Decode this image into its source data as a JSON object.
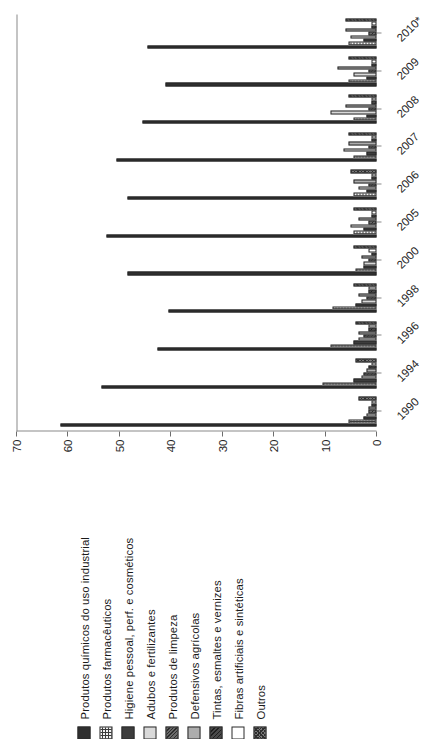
{
  "chart_data": {
    "type": "bar",
    "title": "",
    "xlabel": "",
    "ylabel": "",
    "ylim": [
      0,
      70
    ],
    "yticks": [
      0,
      10,
      20,
      30,
      40,
      50,
      60,
      70
    ],
    "grid": false,
    "orientation": "vertical-groups-rotated",
    "legend_position": "top-left",
    "categories": [
      "1990",
      "1994",
      "1996",
      "1998",
      "2000",
      "2005",
      "2006",
      "2007",
      "2008",
      "2009",
      "2010*"
    ],
    "series": [
      {
        "name": "Produtos químicos do uso industrial",
        "pattern": "solid-dark",
        "values": [
          61.5,
          53.5,
          42.5,
          40.5,
          48.5,
          52.5,
          48.5,
          50.5,
          45.5,
          41.0,
          44.5
        ]
      },
      {
        "name": "Produtos farmacêuticos",
        "pattern": "grid-hatch",
        "values": [
          5.5,
          10.5,
          9.0,
          8.5,
          4.0,
          4.5,
          4.5,
          4.5,
          4.5,
          5.5,
          5.5
        ]
      },
      {
        "name": "Higiene pessoal, perf. e cosméticos",
        "pattern": "solid-dark-2",
        "values": [
          2.5,
          4.5,
          4.5,
          4.0,
          2.5,
          2.5,
          2.0,
          2.0,
          2.0,
          2.0,
          2.5
        ]
      },
      {
        "name": "Adubos e fertilizantes",
        "pattern": "very-light",
        "values": [
          2.0,
          3.0,
          3.5,
          3.0,
          2.5,
          5.0,
          3.5,
          6.5,
          9.0,
          4.5,
          5.0
        ]
      },
      {
        "name": "Produtos de limpeza",
        "pattern": "dense-hatch",
        "values": [
          1.5,
          2.5,
          2.5,
          2.0,
          1.5,
          1.5,
          1.5,
          1.5,
          1.5,
          1.5,
          1.5
        ]
      },
      {
        "name": "Defensivos agrícolas",
        "pattern": "mid-grey",
        "values": [
          1.5,
          2.0,
          3.5,
          3.5,
          3.0,
          3.5,
          4.5,
          5.5,
          6.0,
          7.5,
          6.0
        ]
      },
      {
        "name": "Tintas, esmaltes e vernizes",
        "pattern": "diag-hatch",
        "values": [
          1.0,
          1.5,
          1.5,
          1.5,
          1.0,
          1.0,
          1.0,
          1.0,
          1.0,
          1.0,
          1.0
        ]
      },
      {
        "name": "Fibras artificiais e sintéticas",
        "pattern": "white",
        "values": [
          1.0,
          1.0,
          1.5,
          1.5,
          1.5,
          1.0,
          1.0,
          1.0,
          1.0,
          1.0,
          1.0
        ]
      },
      {
        "name": "Outros",
        "pattern": "cross-hatch",
        "values": [
          3.5,
          4.0,
          4.0,
          4.5,
          4.5,
          4.5,
          5.0,
          5.5,
          5.5,
          5.5,
          6.0
        ]
      }
    ]
  },
  "legend": {
    "items": [
      {
        "label": "Produtos químicos do uso industrial",
        "swatch": "swatch-solid-dark"
      },
      {
        "label": "Produtos farmacêuticos",
        "swatch": "swatch-grid-hatch"
      },
      {
        "label": "Higiene pessoal, perf. e cosméticos",
        "swatch": "swatch-solid-dark-2"
      },
      {
        "label": "Adubos e fertilizantes",
        "swatch": "swatch-very-light"
      },
      {
        "label": "Produtos de limpeza",
        "swatch": "swatch-dense-hatch"
      },
      {
        "label": "Defensivos agrícolas",
        "swatch": "swatch-mid-grey"
      },
      {
        "label": "Tintas, esmaltes e vernizes",
        "swatch": "swatch-diag-hatch"
      },
      {
        "label": "Fibras artificiais e sintéticas",
        "swatch": "swatch-white"
      },
      {
        "label": "Outros",
        "swatch": "swatch-cross-hatch"
      }
    ]
  },
  "axis": {
    "value_ticks": [
      "70",
      "60",
      "50",
      "40",
      "30",
      "20",
      "10",
      "0"
    ],
    "category_ticks": [
      "1990",
      "1994",
      "1996",
      "1998",
      "2000",
      "2005",
      "2006",
      "2007",
      "2008",
      "2009",
      "2010*"
    ]
  },
  "colors": {
    "axis": "#8a8a8a",
    "text": "#262626",
    "series_dark": "#2f2f2f",
    "series_light": "#d9d9d9",
    "background": "#ffffff"
  }
}
